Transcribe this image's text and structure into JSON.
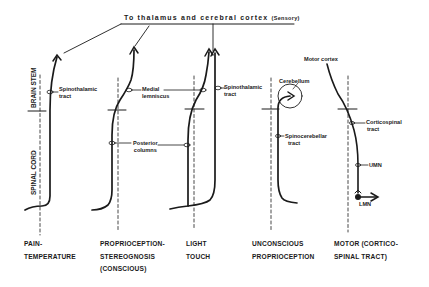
{
  "diagram": {
    "title_main": "To thalamus and cerebral cortex",
    "title_suffix": "(Sensory)",
    "region_labels": {
      "brain_stem": "BRAIN STEM",
      "spinal_cord": "SPINAL CORD"
    },
    "labels": {
      "spinothalamic_1": [
        "Spinothalamic",
        "tract"
      ],
      "medial_lemniscus": [
        "Medial",
        "lemniscus"
      ],
      "spinothalamic_2": [
        "Spinothalamic",
        "tract"
      ],
      "posterior_columns": [
        "Posterior",
        "columns"
      ],
      "cerebellum": "Cerebellum",
      "spinocerebellar": [
        "Spinocerebellar",
        "tract"
      ],
      "motor_cortex": "Motor cortex",
      "corticospinal": [
        "Corticospinal",
        "tract"
      ],
      "umn": "UMN",
      "lmn": "LMN"
    },
    "pathways": [
      {
        "id": "pain-temperature",
        "caption": [
          "PAIN-",
          "TEMPERATURE"
        ]
      },
      {
        "id": "proprioception-stereognosis",
        "caption": [
          "PROPRIOCEPTION-",
          "STEREOGNOSIS",
          "(CONSCIOUS)"
        ]
      },
      {
        "id": "light-touch",
        "caption": [
          "LIGHT",
          "TOUCH"
        ]
      },
      {
        "id": "unconscious-proprioception",
        "caption": [
          "UNCONSCIOUS",
          "PROPRIOCEPTION"
        ]
      },
      {
        "id": "motor",
        "caption": [
          "MOTOR (CORTICO-",
          "SPINAL  TRACT)"
        ]
      }
    ]
  }
}
